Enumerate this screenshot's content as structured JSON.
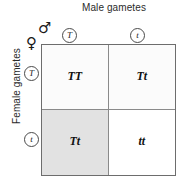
{
  "labels": {
    "male_axis": "Male gametes",
    "female_axis": "Female gametes",
    "male_symbol": "♂",
    "female_symbol": "♀"
  },
  "gametes": {
    "male": [
      {
        "allele": "T",
        "position": "top-left-column"
      },
      {
        "allele": "t",
        "position": "top-right-column"
      }
    ],
    "female": [
      {
        "allele": "T",
        "position": "left-top-row"
      },
      {
        "allele": "t",
        "position": "left-bottom-row"
      }
    ]
  },
  "punnett": {
    "rows": [
      {
        "female_allele": "T",
        "cells": [
          {
            "genotype": "TT",
            "male_allele": "T",
            "shade": "#fbfbfb"
          },
          {
            "genotype": "Tt",
            "male_allele": "t",
            "shade": "#fbfbfb"
          }
        ]
      },
      {
        "female_allele": "t",
        "cells": [
          {
            "genotype": "Tt",
            "male_allele": "T",
            "shade": "#e2e2e2"
          },
          {
            "genotype": "tt",
            "male_allele": "t",
            "shade": "#ffffff"
          }
        ]
      }
    ]
  },
  "colors": {
    "grid_border": "#6d6d6d",
    "cell_divider": "#8a8a8a",
    "text": "#1a1a1a",
    "shaded_cell": "#e2e2e2",
    "light_cell": "#fbfbfb",
    "white_cell": "#ffffff"
  }
}
